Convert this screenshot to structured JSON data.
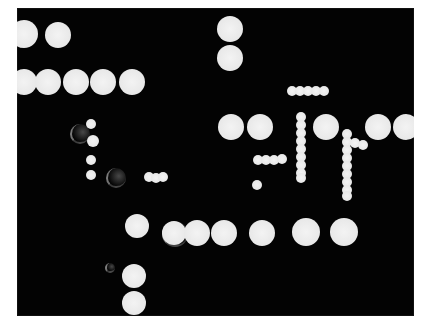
{
  "image": {
    "description": "High-contrast photograph of white circular dots arranged in rows and chains on a black background",
    "colors": {
      "background": "#030303",
      "dot": "#ececec",
      "border": "#ffffff"
    },
    "frame": {
      "left": 17,
      "top": 8,
      "width": 397,
      "height": 308
    }
  },
  "dots": [
    {
      "cx": 24,
      "cy": 34,
      "r": 14
    },
    {
      "cx": 58,
      "cy": 35,
      "r": 13
    },
    {
      "cx": 24,
      "cy": 82,
      "r": 13
    },
    {
      "cx": 48,
      "cy": 82,
      "r": 13
    },
    {
      "cx": 76,
      "cy": 82,
      "r": 13
    },
    {
      "cx": 103,
      "cy": 82,
      "r": 13
    },
    {
      "cx": 132,
      "cy": 82,
      "r": 13
    },
    {
      "cx": 230,
      "cy": 29,
      "r": 13
    },
    {
      "cx": 230,
      "cy": 58,
      "r": 13
    },
    {
      "cx": 231,
      "cy": 127,
      "r": 13
    },
    {
      "cx": 260,
      "cy": 127,
      "r": 13
    },
    {
      "cx": 326,
      "cy": 127,
      "r": 13
    },
    {
      "cx": 378,
      "cy": 127,
      "r": 13
    },
    {
      "cx": 406,
      "cy": 127,
      "r": 13
    },
    {
      "cx": 137,
      "cy": 226,
      "r": 12
    },
    {
      "cx": 174,
      "cy": 233,
      "r": 12
    },
    {
      "cx": 197,
      "cy": 233,
      "r": 13
    },
    {
      "cx": 224,
      "cy": 233,
      "r": 13
    },
    {
      "cx": 262,
      "cy": 233,
      "r": 13
    },
    {
      "cx": 306,
      "cy": 232,
      "r": 14
    },
    {
      "cx": 344,
      "cy": 232,
      "r": 14
    },
    {
      "cx": 134,
      "cy": 276,
      "r": 12
    },
    {
      "cx": 134,
      "cy": 303,
      "r": 12
    }
  ],
  "small_dots": [
    {
      "cx": 292,
      "cy": 91,
      "r": 5
    },
    {
      "cx": 300,
      "cy": 91,
      "r": 5
    },
    {
      "cx": 308,
      "cy": 91,
      "r": 5
    },
    {
      "cx": 316,
      "cy": 91,
      "r": 5
    },
    {
      "cx": 324,
      "cy": 91,
      "r": 5
    },
    {
      "cx": 301,
      "cy": 117,
      "r": 5
    },
    {
      "cx": 301,
      "cy": 125,
      "r": 5
    },
    {
      "cx": 301,
      "cy": 133,
      "r": 5
    },
    {
      "cx": 301,
      "cy": 141,
      "r": 5
    },
    {
      "cx": 301,
      "cy": 149,
      "r": 5
    },
    {
      "cx": 301,
      "cy": 157,
      "r": 5
    },
    {
      "cx": 301,
      "cy": 165,
      "r": 5
    },
    {
      "cx": 301,
      "cy": 173,
      "r": 5
    },
    {
      "cx": 301,
      "cy": 178,
      "r": 5
    },
    {
      "cx": 347,
      "cy": 134,
      "r": 5
    },
    {
      "cx": 347,
      "cy": 142,
      "r": 5
    },
    {
      "cx": 347,
      "cy": 150,
      "r": 5
    },
    {
      "cx": 347,
      "cy": 158,
      "r": 5
    },
    {
      "cx": 347,
      "cy": 166,
      "r": 5
    },
    {
      "cx": 347,
      "cy": 174,
      "r": 5
    },
    {
      "cx": 347,
      "cy": 182,
      "r": 5
    },
    {
      "cx": 347,
      "cy": 190,
      "r": 5
    },
    {
      "cx": 347,
      "cy": 196,
      "r": 5
    },
    {
      "cx": 355,
      "cy": 143,
      "r": 5
    },
    {
      "cx": 363,
      "cy": 145,
      "r": 5
    },
    {
      "cx": 258,
      "cy": 160,
      "r": 5
    },
    {
      "cx": 266,
      "cy": 160,
      "r": 5
    },
    {
      "cx": 274,
      "cy": 160,
      "r": 5
    },
    {
      "cx": 282,
      "cy": 159,
      "r": 5
    },
    {
      "cx": 257,
      "cy": 185,
      "r": 5
    },
    {
      "cx": 91,
      "cy": 124,
      "r": 5
    },
    {
      "cx": 93,
      "cy": 141,
      "r": 6
    },
    {
      "cx": 91,
      "cy": 160,
      "r": 5
    },
    {
      "cx": 91,
      "cy": 175,
      "r": 5
    },
    {
      "cx": 149,
      "cy": 177,
      "r": 5
    },
    {
      "cx": 156,
      "cy": 178,
      "r": 5
    },
    {
      "cx": 163,
      "cy": 177,
      "r": 5
    }
  ],
  "ghosts": [
    {
      "cx": 79,
      "cy": 133,
      "r": 9
    },
    {
      "cx": 115,
      "cy": 177,
      "r": 9
    },
    {
      "cx": 174,
      "cy": 233,
      "r": 12
    },
    {
      "cx": 109,
      "cy": 267,
      "r": 4
    }
  ]
}
